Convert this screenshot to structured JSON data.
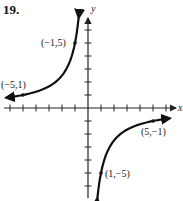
{
  "problem_number": "19.",
  "chart_data": {
    "type": "line",
    "title": "",
    "function": "y = -5/x",
    "xlabel": "x",
    "ylabel": "y",
    "xlim": [
      -6.5,
      6.5
    ],
    "ylim": [
      -7,
      7
    ],
    "grid": false,
    "x_ticks": [
      -6,
      -5,
      -4,
      -3,
      -2,
      -1,
      1,
      2,
      3,
      4,
      5,
      6
    ],
    "y_ticks": [
      -6,
      -5,
      -4,
      -3,
      -2,
      -1,
      1,
      2,
      3,
      4,
      5,
      6
    ],
    "series": [
      {
        "name": "left branch",
        "x": [
          -6.3,
          -5,
          -3,
          -2,
          -1.5,
          -1,
          -0.8,
          -0.72
        ],
        "y": [
          0.79,
          1,
          1.67,
          2.5,
          3.33,
          5,
          6.25,
          6.9
        ]
      },
      {
        "name": "right branch",
        "x": [
          0.72,
          0.8,
          1,
          1.5,
          2,
          3,
          5,
          6.3
        ],
        "y": [
          -6.9,
          -6.25,
          -5,
          -3.33,
          -2.5,
          -1.67,
          -1,
          -0.79
        ]
      }
    ],
    "annotations": [
      {
        "label": "(−1,5)",
        "x": -1,
        "y": 5
      },
      {
        "label": "(−5,1)",
        "x": -5,
        "y": 1
      },
      {
        "label": "(5,−1)",
        "x": 5,
        "y": -1
      },
      {
        "label": "(1,−5)",
        "x": 1,
        "y": -5
      }
    ]
  }
}
